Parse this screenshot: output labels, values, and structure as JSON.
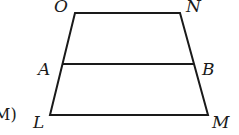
{
  "diagram": {
    "type": "trapezoid",
    "option_label": "M)",
    "vertices": {
      "O": {
        "label": "O",
        "x": 75,
        "y": 13
      },
      "N": {
        "label": "N",
        "x": 180,
        "y": 13
      },
      "A": {
        "label": "A",
        "x": 62,
        "y": 64
      },
      "B": {
        "label": "B",
        "x": 194,
        "y": 64
      },
      "L": {
        "label": "L",
        "x": 50,
        "y": 115
      },
      "M": {
        "label": "M",
        "x": 208,
        "y": 115
      }
    },
    "segments": [
      "ON",
      "NM",
      "ML",
      "LO",
      "AB"
    ],
    "color": "#1a1a1a"
  }
}
